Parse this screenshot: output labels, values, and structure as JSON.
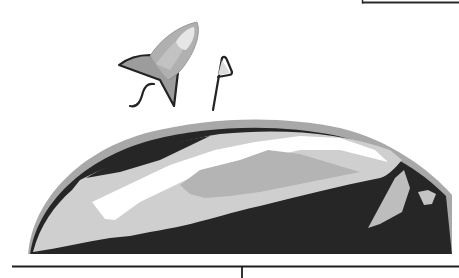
{
  "illustration": {
    "subject": "rocket launching over a planet with a flag",
    "colors": {
      "background": "#ffffff",
      "outline": "#232323",
      "planet_rim": "#a8a8a8",
      "planet_light": "#cfcfcf",
      "planet_mid": "#b4b4b4",
      "planet_dark": "#262626",
      "highlight": "#ffffff",
      "rocket_body": "#b0b0b0",
      "rocket_window": "#e6e6e6",
      "flag_fill": "#d8d8d8"
    },
    "elements": [
      {
        "name": "rocket",
        "icon": "rocket-icon"
      },
      {
        "name": "flag",
        "icon": "flag-icon"
      },
      {
        "name": "planet",
        "icon": "planet-dome"
      },
      {
        "name": "ground-line",
        "icon": "divider"
      },
      {
        "name": "top-right-frame-line",
        "icon": "divider"
      }
    ]
  }
}
